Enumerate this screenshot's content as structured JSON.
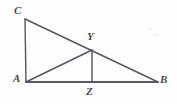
{
  "figure": {
    "background_color": "#fefefe",
    "stroke_color": "#55555f",
    "baseline_color": "#5c5768",
    "label_color": "#4a4a55",
    "stroke_width": 1.4,
    "baseline_width": 2.0,
    "width": 177,
    "height": 104,
    "points": {
      "C": {
        "label": "C",
        "x": 25,
        "y": 19,
        "label_x": 14,
        "label_y": 5
      },
      "A": {
        "label": "A",
        "x": 26,
        "y": 82,
        "label_x": 13,
        "label_y": 73
      },
      "B": {
        "label": "B",
        "x": 158,
        "y": 82,
        "label_x": 160,
        "label_y": 74
      },
      "Y": {
        "label": "Y",
        "x": 92,
        "y": 50,
        "label_x": 87,
        "label_y": 31
      },
      "Z": {
        "label": "Z",
        "x": 92,
        "y": 82,
        "label_x": 86,
        "label_y": 86
      }
    },
    "segments": [
      {
        "name": "segment-CA",
        "x1": 25,
        "y1": 19,
        "x2": 26,
        "y2": 82,
        "kind": "leg"
      },
      {
        "name": "segment-CB",
        "x1": 25,
        "y1": 19,
        "x2": 158,
        "y2": 82,
        "kind": "hypotenuse"
      },
      {
        "name": "segment-AB",
        "x1": 26,
        "y1": 82,
        "x2": 158,
        "y2": 82,
        "kind": "baseline"
      },
      {
        "name": "segment-AY",
        "x1": 26,
        "y1": 82,
        "x2": 92,
        "y2": 50,
        "kind": "cevian"
      },
      {
        "name": "segment-YZ",
        "x1": 92,
        "y1": 50,
        "x2": 92,
        "y2": 82,
        "kind": "altitude"
      }
    ]
  }
}
